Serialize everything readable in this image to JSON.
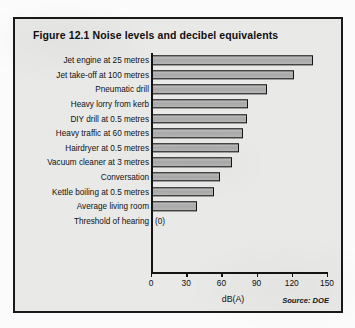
{
  "figure": {
    "title": "Figure 12.1  Noise levels and decibel equivalents",
    "source": "Source: DOE",
    "zero_tag": "(0)"
  },
  "chart_data": {
    "type": "bar",
    "orientation": "horizontal",
    "title": "Figure 12.1  Noise levels and decibel equivalents",
    "xlabel": "dB(A)",
    "ylabel": "",
    "xlim": [
      0,
      150
    ],
    "xticks": [
      0,
      30,
      60,
      90,
      120,
      150
    ],
    "grid": false,
    "legend": false,
    "source": "Source: DOE",
    "categories": [
      "Jet engine at 25 metres",
      "Jet take-off at 100 metres",
      "Pneumatic drill",
      "Heavy lorry from kerb",
      "DIY drill at 0.5 metres",
      "Heavy traffic at 60 metres",
      "Hairdryer at 0.5 metres",
      "Vacuum cleaner at 3 metres",
      "Conversation",
      "Kettle boiling at 0.5 metres",
      "Average living room",
      "Threshold of hearing"
    ],
    "values": [
      138,
      122,
      99,
      83,
      82,
      78,
      75,
      69,
      59,
      54,
      39,
      0
    ],
    "value_labels": [
      "",
      "",
      "",
      "",
      "",
      "",
      "",
      "",
      "",
      "",
      "",
      "(0)"
    ]
  },
  "axis": {
    "tick_labels": [
      "0",
      "30",
      "60",
      "90",
      "120",
      "150"
    ],
    "x_title": "dB(A)"
  }
}
